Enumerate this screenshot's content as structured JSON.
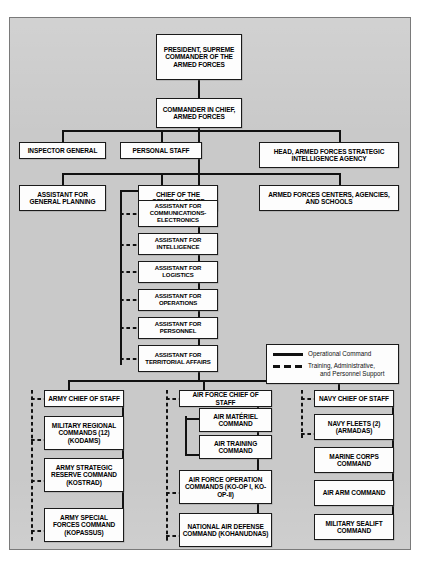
{
  "diagram": {
    "type": "organization-chart",
    "title_visible": false,
    "background_color": "#c9c9c9",
    "box_fill_color": "#fdfdfd",
    "line_color": "#111111",
    "nodes": {
      "president": "PRESIDENT, SUPREME COMMANDER OF THE ARMED FORCES",
      "cinc": "COMMANDER IN CHIEF, ARMED FORCES",
      "inspector_general": "INSPECTOR GENERAL",
      "personal_staff": "PERSONAL STAFF",
      "intel_agency": "HEAD, ARMED FORCES STRATEGIC INTELLIGENCE AGENCY",
      "assistant_general_planning": "ASSISTANT FOR GENERAL PLANNING",
      "chief_general_staff": "CHIEF OF THE GENERAL STAFF",
      "centers_agencies_schools": "ARMED FORCES CENTERS, AGENCIES, AND SCHOOLS",
      "assistants": [
        "ASSISTANT FOR COMMUNICATIONS-ELECTRONICS",
        "ASSISTANT FOR INTELLIGENCE",
        "ASSISTANT FOR LOGISTICS",
        "ASSISTANT FOR OPERATIONS",
        "ASSISTANT FOR PERSONNEL",
        "ASSISTANT FOR TERRITORIAL AFFAIRS"
      ],
      "army": {
        "chief": "ARMY CHIEF OF STAFF",
        "commands": [
          "MILITARY REGIONAL COMMANDS (12) (KODAMS)",
          "ARMY STRATEGIC RESERVE COMMAND (KOSTRAD)",
          "ARMY SPECIAL FORCES COMMAND (KOPASSUS)"
        ]
      },
      "air_force": {
        "chief": "AIR FORCE CHIEF OF STAFF",
        "commands": [
          "AIR MATÉRIEL COMMAND",
          "AIR TRAINING COMMAND",
          "AIR FORCE OPERATION COMMANDS (KO-OP I, KO-OP-II)",
          "NATIONAL AIR DEFENSE COMMAND (KOHANUDNAS)"
        ]
      },
      "navy": {
        "chief": "NAVY CHIEF OF STAFF",
        "commands": [
          "NAVY FLEETS (2) (ARMADAS)",
          "MARINE CORPS COMMAND",
          "AIR ARM COMMAND",
          "MILITARY SEALIFT COMMAND"
        ]
      }
    },
    "legend": {
      "items": [
        {
          "key": "solid",
          "label": "Operational Command",
          "label_line2": ""
        },
        {
          "key": "dashed",
          "label": "Training, Administrative,",
          "label_line2": "and Personnel Support"
        }
      ]
    }
  }
}
